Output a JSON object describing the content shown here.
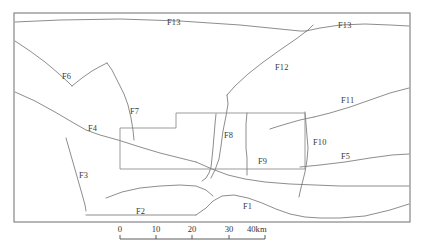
{
  "figure": {
    "type": "geological-fault-map",
    "width": 422,
    "height": 250,
    "background_color": "#ffffff",
    "line_color": "#787878",
    "frame_color": "#6e6e6e",
    "label_color": "#3a3a3a"
  },
  "frame": {
    "x": 14,
    "y": 13,
    "width": 396,
    "height": 209
  },
  "fault_labels": [
    {
      "id": "F13",
      "text": "F13",
      "x": 167,
      "y": 25
    },
    {
      "id": "F13b",
      "text": "F13",
      "x": 338,
      "y": 28
    },
    {
      "id": "F12",
      "text": "F12",
      "x": 275,
      "y": 70
    },
    {
      "id": "F6",
      "text": "F6",
      "x": 62,
      "y": 79
    },
    {
      "id": "F7",
      "text": "F7",
      "x": 130,
      "y": 114
    },
    {
      "id": "F11",
      "text": "F11",
      "x": 341,
      "y": 103
    },
    {
      "id": "F4",
      "text": "F4",
      "x": 88,
      "y": 131
    },
    {
      "id": "F8",
      "text": "F8",
      "x": 224,
      "y": 138
    },
    {
      "id": "F10",
      "text": "F10",
      "x": 313,
      "y": 145
    },
    {
      "id": "F9",
      "text": "F9",
      "x": 258,
      "y": 164
    },
    {
      "id": "F5",
      "text": "F5",
      "x": 341,
      "y": 159
    },
    {
      "id": "F3",
      "text": "F3",
      "x": 79,
      "y": 178
    },
    {
      "id": "F2",
      "text": "F2",
      "x": 136,
      "y": 214
    },
    {
      "id": "F1",
      "text": "F1",
      "x": 243,
      "y": 209
    }
  ],
  "fault_lines": [
    {
      "id": "F13-north",
      "label": "F13",
      "points": "15,22 60,20 120,19 180,21 240,25 280,29 300,31 306,31"
    },
    {
      "id": "F13-northeast",
      "label": "F13",
      "points": "306,31 320,28 340,25 365,24 390,25 409,26"
    },
    {
      "id": "F12",
      "label": "F12",
      "points": "227,95 235,86 248,74 262,63 280,50 296,39 308,30 313,25"
    },
    {
      "id": "F12-south",
      "label": "F12",
      "points": "227,95 228,104 226,116 223,131 221,146 219,159 215,170 211,178"
    },
    {
      "id": "F6",
      "label": "F6",
      "points": "15,41 30,51 45,62 58,73 68,82 72,86"
    },
    {
      "id": "F6-east",
      "label": "F6",
      "points": "72,86 82,78 92,71 101,66 107,63"
    },
    {
      "id": "F7",
      "label": "F7",
      "points": "107,63 112,70 118,82 124,94 128,105 131,118 133,130 134,140"
    },
    {
      "id": "F4",
      "label": "F4",
      "points": "15,92 35,101 55,112 72,122 86,130 100,135 118,140 140,147 160,153 180,158 196,162"
    },
    {
      "id": "F4-east",
      "label": "F4",
      "points": "196,162 212,169 228,175 245,179 265,182 290,184 315,185 340,186 370,186 395,186 409,186"
    },
    {
      "id": "F3",
      "label": "F3",
      "points": "66,138 70,152 74,166 78,180 82,194 85,205 86,211"
    },
    {
      "id": "F11",
      "label": "F11",
      "points": "314,117 330,113 350,107 370,100 390,93 409,88"
    },
    {
      "id": "F11-west",
      "label": "F11",
      "points": "314,117 300,120 286,124 276,127 270,129"
    },
    {
      "id": "F10",
      "label": "F10",
      "points": "305,112 306,124 307,136 308,148 307,160 305,172 302,184 300,192 299,197"
    },
    {
      "id": "F5",
      "label": "F5",
      "points": "300,167 320,165 345,162 370,158 392,155 409,154"
    },
    {
      "id": "F8",
      "label": "F8",
      "points": "216,114 215,124 214,136 213,148 212,158 211,167 209,173 206,178 202,181"
    },
    {
      "id": "F9",
      "label": "F9",
      "points": "247,113 246,124 246,136 246,148 247,158 247,168 247,175"
    },
    {
      "id": "F2-curve",
      "label": "F2",
      "points": "106,198 122,192 140,188 160,186 180,185 196,186 206,190 213,196"
    },
    {
      "id": "F2-line",
      "label": "F2",
      "points": "86,215 120,215 160,215 186,215 196,215"
    },
    {
      "id": "F1",
      "label": "F1",
      "points": "196,215 206,208 213,201 222,196 234,195 248,198 262,203 276,209 290,214 305,217 320,218 340,218 365,216 390,210 409,204"
    }
  ],
  "block_outline": {
    "id": "survey-block",
    "points": "120,128 120,169 305,169 305,113 176,113 176,128 120,128"
  },
  "scalebar": {
    "x_start": 120,
    "x_end": 265,
    "y_line": 239,
    "tick_height": 4,
    "ticks": [
      {
        "value": "0",
        "x": 120
      },
      {
        "value": "10",
        "x": 156
      },
      {
        "value": "20",
        "x": 192
      },
      {
        "value": "30",
        "x": 229
      },
      {
        "value": "40km",
        "x": 265
      }
    ],
    "unit": "km",
    "max_value": 40
  },
  "chart_data": {
    "type": "map",
    "xlabel": "",
    "ylabel": "",
    "features": [
      "F1",
      "F2",
      "F3",
      "F4",
      "F5",
      "F6",
      "F7",
      "F8",
      "F9",
      "F10",
      "F11",
      "F12",
      "F13"
    ],
    "feature_count": 13,
    "scale_bar_km": [
      0,
      10,
      20,
      30,
      40
    ],
    "scale_unit": "km",
    "legend": "none",
    "grid": false
  }
}
